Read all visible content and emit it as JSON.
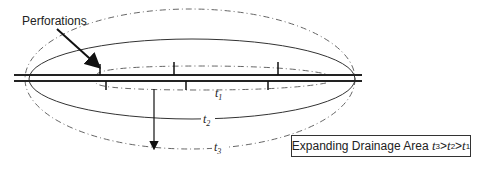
{
  "diagram": {
    "perforations_label": "Perforations",
    "contours": [
      {
        "id": "t1",
        "label": "t",
        "subscript": "1",
        "style": "dash-dot, inner"
      },
      {
        "id": "t2",
        "label": "t",
        "subscript": "2",
        "style": "solid, middle"
      },
      {
        "id": "t3",
        "label": "t",
        "subscript": "3",
        "style": "dash-dot, outer"
      }
    ],
    "legend": {
      "prefix": "Expanding Drainage Area ",
      "t3": "t",
      "t3_sub": "3",
      "gt1": ">",
      "t2": "t",
      "t2_sub": "2",
      "gt2": ">",
      "t1": "t",
      "t1_sub": "1"
    },
    "colors": {
      "line": "#222222",
      "dash": "#555555",
      "background": "#ffffff"
    }
  }
}
